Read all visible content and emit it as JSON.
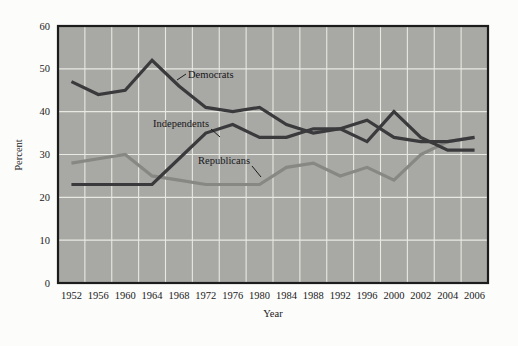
{
  "chart_data": {
    "type": "line",
    "title": "",
    "subtitle": "",
    "xlabel": "Year",
    "ylabel": "Percent",
    "ylim": [
      0,
      60
    ],
    "ytick_labels": [
      "0",
      "10",
      "20",
      "30",
      "40",
      "50",
      "60"
    ],
    "yticks": [
      0,
      10,
      20,
      30,
      40,
      50,
      60
    ],
    "grid": true,
    "grid_axes": "both",
    "legend": "inline-annotations",
    "legend_position": "inside-plot",
    "categories": [
      "1952",
      "1956",
      "1960",
      "1964",
      "1968",
      "1972",
      "1976",
      "1980",
      "1984",
      "1988",
      "1992",
      "1996",
      "2000",
      "2002",
      "2004",
      "2006"
    ],
    "x": [
      1952,
      1956,
      1960,
      1964,
      1968,
      1972,
      1976,
      1980,
      1984,
      1988,
      1992,
      1996,
      2000,
      2002,
      2004,
      2006
    ],
    "series": [
      {
        "name": "Democrats",
        "color": "#3a3a3d",
        "line_width": 3.2,
        "values": [
          47,
          44,
          45,
          52,
          46,
          41,
          40,
          41,
          37,
          35,
          36,
          38,
          34,
          33,
          33,
          34
        ]
      },
      {
        "name": "Independents",
        "color": "#3a3a3d",
        "line_width": 3.2,
        "values": [
          23,
          23,
          23,
          23,
          29,
          35,
          37,
          34,
          34,
          36,
          36,
          33,
          40,
          34,
          31,
          31
        ]
      },
      {
        "name": "Republicans",
        "color": "#878784",
        "line_width": 3.2,
        "values": [
          28,
          29,
          30,
          25,
          24,
          23,
          23,
          23,
          27,
          28,
          25,
          27,
          24,
          30,
          33,
          34
        ]
      }
    ],
    "annotations": [
      {
        "text": "Democrats",
        "series": "Democrats"
      },
      {
        "text": "Independents",
        "series": "Independents"
      },
      {
        "text": "Republicans",
        "series": "Republicans"
      }
    ],
    "colors": {
      "plot_background": "#a8a8a4",
      "figure_background": "#fcfcfa",
      "grid": "#e9e9e4",
      "frame": "#1c1c1c",
      "dark_series": "#3a3a3d",
      "light_series": "#878784",
      "text": "#1a1a1a"
    }
  }
}
